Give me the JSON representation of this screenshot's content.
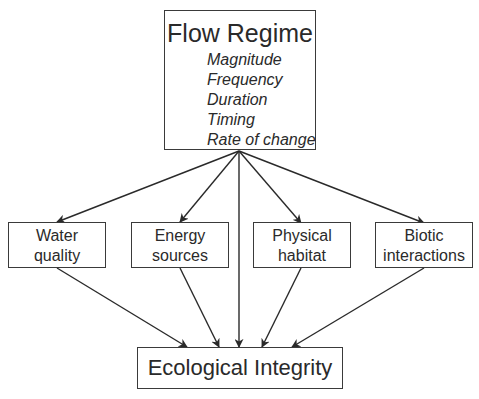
{
  "diagram": {
    "top": {
      "title": "Flow Regime",
      "attributes": [
        "Magnitude",
        "Frequency",
        "Duration",
        "Timing",
        "Rate of change"
      ]
    },
    "middle": [
      {
        "line1": "Water",
        "line2": "quality"
      },
      {
        "line1": "Energy",
        "line2": "sources"
      },
      {
        "line1": "Physical",
        "line2": "habitat"
      },
      {
        "line1": "Biotic",
        "line2": "interactions"
      }
    ],
    "bottom": {
      "title": "Ecological Integrity"
    },
    "edges": [
      {
        "from": "Flow Regime",
        "to": "Water quality"
      },
      {
        "from": "Flow Regime",
        "to": "Energy sources"
      },
      {
        "from": "Flow Regime",
        "to": "Ecological Integrity"
      },
      {
        "from": "Flow Regime",
        "to": "Physical habitat"
      },
      {
        "from": "Flow Regime",
        "to": "Biotic interactions"
      },
      {
        "from": "Water quality",
        "to": "Ecological Integrity"
      },
      {
        "from": "Energy sources",
        "to": "Ecological Integrity"
      },
      {
        "from": "Physical habitat",
        "to": "Ecological Integrity"
      },
      {
        "from": "Biotic interactions",
        "to": "Ecological Integrity"
      }
    ],
    "colors": {
      "line": "#2a2a2a",
      "background": "#ffffff"
    }
  }
}
